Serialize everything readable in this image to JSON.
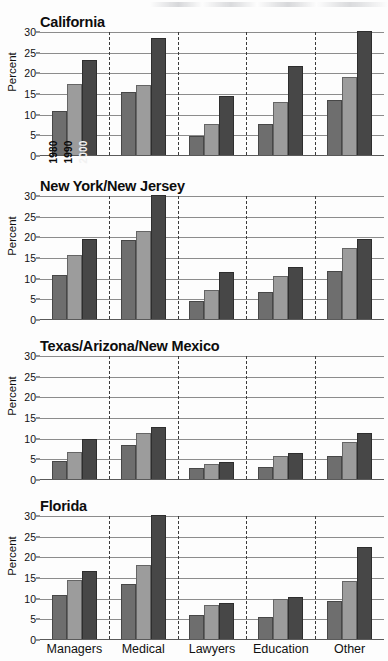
{
  "figure": {
    "ylabel": "Percent",
    "yticks": [
      0,
      5,
      10,
      15,
      20,
      25,
      30
    ],
    "categories": [
      "Managers",
      "Medical",
      "Lawyers",
      "Education",
      "Other"
    ],
    "series_names": [
      "1980",
      "1990",
      "2000"
    ],
    "colors": {
      "y1980": "#6e6e6e",
      "y1990": "#9c9c9c",
      "y2000": "#474747",
      "gridline": "#8c8c8c",
      "axis": "#5a5a5a",
      "text": "#101010"
    }
  },
  "chart_data": [
    {
      "type": "bar",
      "title": "California",
      "xlabel": "",
      "ylabel": "Percent",
      "ylim": [
        0,
        30
      ],
      "yticks": [
        0,
        5,
        10,
        15,
        20,
        25,
        30
      ],
      "grid": true,
      "legend_position": "in-plot-rotated-on-first-group",
      "categories": [
        "Managers",
        "Medical",
        "Lawyers",
        "Education",
        "Other"
      ],
      "series": [
        {
          "name": "1980",
          "values": [
            10.7,
            15.3,
            4.5,
            7.4,
            13.2
          ]
        },
        {
          "name": "1990",
          "values": [
            17.3,
            16.9,
            7.4,
            12.9,
            18.9
          ]
        },
        {
          "name": "2000",
          "values": [
            23.0,
            28.2,
            14.2,
            21.6,
            32.5
          ]
        }
      ]
    },
    {
      "type": "bar",
      "title": "New York/New Jersey",
      "xlabel": "",
      "ylabel": "Percent",
      "ylim": [
        0,
        30
      ],
      "yticks": [
        0,
        5,
        10,
        15,
        20,
        25,
        30
      ],
      "grid": true,
      "categories": [
        "Managers",
        "Medical",
        "Lawyers",
        "Education",
        "Other"
      ],
      "series": [
        {
          "name": "1980",
          "values": [
            10.6,
            19.2,
            4.3,
            6.6,
            11.7
          ]
        },
        {
          "name": "1990",
          "values": [
            15.4,
            21.4,
            7.0,
            10.5,
            17.1
          ]
        },
        {
          "name": "2000",
          "values": [
            19.4,
            30.8,
            11.3,
            12.7,
            19.4
          ]
        }
      ]
    },
    {
      "type": "bar",
      "title": "Texas/Arizona/New Mexico",
      "xlabel": "",
      "ylabel": "Percent",
      "ylim": [
        0,
        30
      ],
      "yticks": [
        0,
        5,
        10,
        15,
        20,
        25,
        30
      ],
      "grid": true,
      "categories": [
        "Managers",
        "Medical",
        "Lawyers",
        "Education",
        "Other"
      ],
      "series": [
        {
          "name": "1980",
          "values": [
            4.3,
            8.3,
            2.6,
            2.9,
            5.6
          ]
        },
        {
          "name": "1990",
          "values": [
            6.6,
            11.1,
            3.7,
            5.5,
            9.0
          ]
        },
        {
          "name": "2000",
          "values": [
            9.7,
            12.5,
            4.1,
            6.4,
            11.2
          ]
        }
      ]
    },
    {
      "type": "bar",
      "title": "Florida",
      "xlabel": "",
      "ylabel": "Percent",
      "ylim": [
        0,
        30
      ],
      "yticks": [
        0,
        5,
        10,
        15,
        20,
        25,
        30
      ],
      "grid": true,
      "categories": [
        "Managers",
        "Medical",
        "Lawyers",
        "Education",
        "Other"
      ],
      "series": [
        {
          "name": "1980",
          "values": [
            10.6,
            13.4,
            5.7,
            5.4,
            9.2
          ]
        },
        {
          "name": "1990",
          "values": [
            14.2,
            17.8,
            8.2,
            9.6,
            14.0
          ]
        },
        {
          "name": "2000",
          "values": [
            16.5,
            30.1,
            8.7,
            10.2,
            22.2
          ]
        }
      ]
    }
  ]
}
